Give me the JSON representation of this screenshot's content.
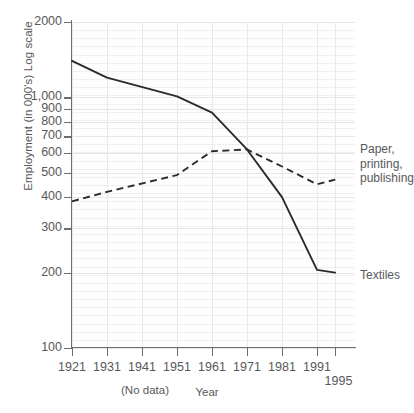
{
  "chart_data": {
    "type": "line",
    "title": "",
    "xlabel": "Year",
    "ylabel": "Employment (in 000's) Log scale",
    "x": [
      1921,
      1931,
      1941,
      1951,
      1961,
      1971,
      1981,
      1991,
      1995
    ],
    "x_tick_labels": [
      "1921",
      "1931",
      "1941",
      "1951",
      "1961",
      "1971",
      "1981",
      "1991",
      "1995"
    ],
    "y_tick_labels": [
      "2000",
      "1,000",
      "900",
      "800",
      "700",
      "600",
      "500",
      "400",
      "300",
      "200",
      "100"
    ],
    "y_tick_values": [
      2000,
      1000,
      900,
      800,
      700,
      600,
      500,
      400,
      300,
      200,
      100
    ],
    "yscale": "log",
    "ylim": [
      100,
      2000
    ],
    "grid": true,
    "legend_position": "right-inline",
    "annotations": [
      "(No data)"
    ],
    "series": [
      {
        "name": "Textiles",
        "style": "solid",
        "color": "#2b2b2b",
        "label_position": "right",
        "values": [
          1400,
          1200,
          null,
          1010,
          870,
          620,
          400,
          205,
          200
        ]
      },
      {
        "name": "Paper, printing, publishing",
        "style": "dashed",
        "color": "#2b2b2b",
        "label_position": "right",
        "label_lines": [
          "Paper,",
          "printing,",
          "publishing"
        ],
        "values": [
          385,
          420,
          null,
          490,
          610,
          620,
          530,
          450,
          470
        ]
      }
    ]
  },
  "axes": {
    "y_title": "Employment (in 000's) Log scale",
    "x_title": "Year",
    "no_data_note": "(No data)"
  },
  "y_ticks": [
    {
      "label": "2000",
      "value": 2000
    },
    {
      "label": "1,000",
      "value": 1000
    },
    {
      "label": "900",
      "value": 900
    },
    {
      "label": "800",
      "value": 800
    },
    {
      "label": "700",
      "value": 700
    },
    {
      "label": "600",
      "value": 600
    },
    {
      "label": "500",
      "value": 500
    },
    {
      "label": "400",
      "value": 400
    },
    {
      "label": "300",
      "value": 300
    },
    {
      "label": "200",
      "value": 200
    },
    {
      "label": "100",
      "value": 100
    }
  ],
  "x_ticks": [
    {
      "label": "1921",
      "value": 1921,
      "offset": false
    },
    {
      "label": "1931",
      "value": 1931,
      "offset": false
    },
    {
      "label": "1941",
      "value": 1941,
      "offset": false
    },
    {
      "label": "1951",
      "value": 1951,
      "offset": false
    },
    {
      "label": "1961",
      "value": 1961,
      "offset": false
    },
    {
      "label": "1971",
      "value": 1971,
      "offset": false
    },
    {
      "label": "1981",
      "value": 1981,
      "offset": false
    },
    {
      "label": "1991",
      "value": 1991,
      "offset": false
    },
    {
      "label": "1995",
      "value": 1995,
      "offset": true
    }
  ],
  "series_labels": {
    "paper": "Paper,\nprinting,\npublishing",
    "paper_line1": "Paper,",
    "paper_line2": "printing,",
    "paper_line3": "publishing",
    "textiles": "Textiles"
  },
  "colors": {
    "line": "#2b2b2b",
    "axis": "#6e6e72",
    "text": "#58585a",
    "grid_minor": "#f0eff3",
    "grid_major": "#e6e5ea"
  }
}
